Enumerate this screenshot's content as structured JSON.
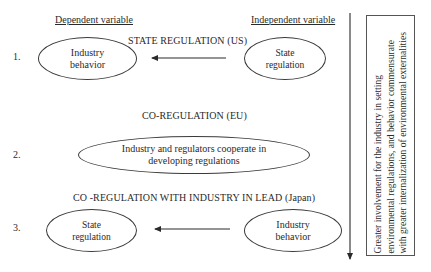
{
  "headers": {
    "dependent": "Dependent variable",
    "independent": "Independent variable"
  },
  "rows": [
    {
      "number": "1.",
      "title": "STATE REGULATION (US)",
      "dependent_node": {
        "line1": "Industry",
        "line2": "behavior"
      },
      "independent_node": {
        "line1": "State",
        "line2": "regulation"
      },
      "arrow_direction": "right-to-left"
    },
    {
      "number": "2.",
      "title": "CO-REGULATION (EU)",
      "node": {
        "line1": "Industry and regulators cooperate in",
        "line2": "developing regulations"
      }
    },
    {
      "number": "3.",
      "title": "CO -REGULATION WITH INDUSTRY IN LEAD (Japan)",
      "dependent_node": {
        "line1": "State",
        "line2": "regulation"
      },
      "independent_node": {
        "line1": "Industry",
        "line2": "behavior"
      },
      "arrow_direction": "right-to-left"
    }
  ],
  "side_note": {
    "line1": "Greater involvement for the industry in setting",
    "line2": "environmental regulations, and behavior commensurate",
    "line3": "with greater internalization of environmental externalities"
  },
  "colors": {
    "stroke": "#3a3a3a",
    "text": "#2a2a2a",
    "background": "#ffffff"
  }
}
